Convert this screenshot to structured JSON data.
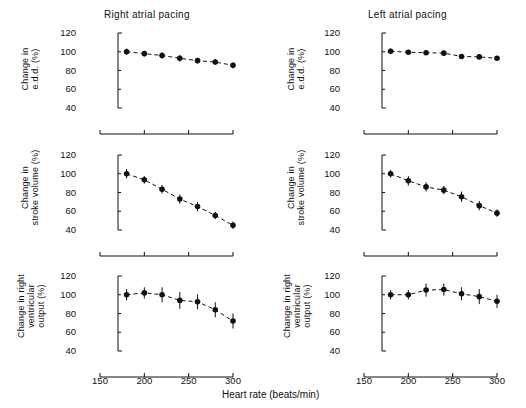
{
  "figure": {
    "xlabel": "Heart rate (beats/min)",
    "columns": [
      {
        "key": "right",
        "title": "Right atrial pacing"
      },
      {
        "key": "left",
        "title": "Left atrial pacing"
      }
    ]
  },
  "axes": {
    "yticks": [
      "120",
      "100",
      "80",
      "60",
      "40"
    ],
    "ytick_values": [
      120,
      100,
      80,
      60,
      40
    ],
    "ylim": [
      40,
      120
    ],
    "xticks": [
      "150",
      "200",
      "250",
      "300"
    ],
    "xtick_values": [
      150,
      200,
      250,
      300
    ],
    "xlim": [
      150,
      300
    ]
  },
  "row_labels": {
    "edd": "Change in\ne.d.d. (%)",
    "edd_lines": [
      "Change in",
      "e.d.d. (%)"
    ],
    "sv_lines": [
      "Change in",
      "stroke volume (%)"
    ],
    "rvo_lines": [
      "Change in right",
      "ventricular",
      "output (%)"
    ]
  },
  "chart_data": [
    {
      "type": "line",
      "panel": "top-left",
      "title": "Right atrial pacing",
      "ylabel": "Change in e.d.d. (%)",
      "xlabel": "",
      "x": [
        180,
        200,
        220,
        240,
        260,
        280,
        300
      ],
      "values": [
        100,
        98,
        96,
        93,
        90.5,
        89,
        85.5
      ],
      "errors": [
        3.5,
        3,
        3.5,
        3.5,
        3,
        3,
        3
      ],
      "ylim": [
        40,
        120
      ],
      "xlim": [
        150,
        300
      ],
      "grid": false,
      "legend": "none"
    },
    {
      "type": "line",
      "panel": "middle-left",
      "title": "",
      "ylabel": "Change in stroke volume (%)",
      "xlabel": "",
      "x": [
        180,
        200,
        220,
        240,
        260,
        280,
        300
      ],
      "values": [
        100,
        93.5,
        83.5,
        73,
        65,
        55.5,
        45
      ],
      "errors": [
        5,
        4,
        4.5,
        5,
        5,
        4,
        4
      ],
      "ylim": [
        40,
        120
      ],
      "xlim": [
        150,
        300
      ],
      "grid": false,
      "legend": "none"
    },
    {
      "type": "line",
      "panel": "bottom-left",
      "title": "",
      "ylabel": "Change in right ventricular output (%)",
      "xlabel": "Heart rate (beats/min)",
      "x": [
        180,
        200,
        220,
        240,
        260,
        280,
        300
      ],
      "values": [
        100,
        102,
        100,
        94,
        92.5,
        84,
        72
      ],
      "errors": [
        6,
        6,
        8,
        9,
        8,
        8,
        8
      ],
      "ylim": [
        40,
        120
      ],
      "xlim": [
        150,
        300
      ],
      "grid": false,
      "legend": "none"
    },
    {
      "type": "line",
      "panel": "top-right",
      "title": "Left atrial pacing",
      "ylabel": "Change in e.d.d. (%)",
      "xlabel": "",
      "x": [
        180,
        200,
        220,
        240,
        260,
        280,
        300
      ],
      "values": [
        100.5,
        99.5,
        99,
        98.5,
        95,
        94.5,
        93
      ],
      "errors": [
        3,
        2.5,
        2.5,
        2.5,
        2.5,
        2.5,
        2.5
      ],
      "ylim": [
        40,
        120
      ],
      "xlim": [
        150,
        300
      ],
      "grid": false,
      "legend": "none"
    },
    {
      "type": "line",
      "panel": "middle-right",
      "title": "",
      "ylabel": "Change in stroke volume (%)",
      "xlabel": "",
      "x": [
        180,
        200,
        220,
        240,
        260,
        280,
        300
      ],
      "values": [
        100,
        92.5,
        86,
        82.5,
        75.5,
        66,
        58
      ],
      "errors": [
        4,
        5,
        5,
        4.5,
        5.5,
        5,
        4
      ],
      "ylim": [
        40,
        120
      ],
      "xlim": [
        150,
        300
      ],
      "grid": false,
      "legend": "none"
    },
    {
      "type": "line",
      "panel": "bottom-right",
      "title": "",
      "ylabel": "Change in right ventricular output (%)",
      "xlabel": "Heart rate (beats/min)",
      "x": [
        180,
        200,
        220,
        240,
        260,
        280,
        300
      ],
      "values": [
        100,
        100,
        105,
        105.5,
        101,
        98,
        93
      ],
      "errors": [
        5,
        5,
        7,
        6.5,
        7,
        8,
        7
      ],
      "ylim": [
        40,
        120
      ],
      "xlim": [
        150,
        300
      ],
      "grid": false,
      "legend": "none"
    }
  ]
}
